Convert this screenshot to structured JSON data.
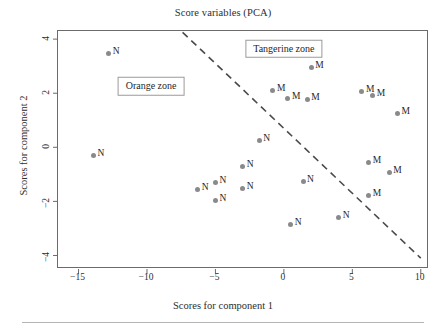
{
  "chart_data": {
    "type": "scatter",
    "title": "Score variables (PCA)",
    "xlabel": "Scores for component 1",
    "ylabel": "Scores for component 2",
    "xlim": [
      -16.5,
      10.6
    ],
    "ylim": [
      -4.5,
      4.3
    ],
    "xticks": [
      -15,
      -10,
      -5,
      0,
      5,
      10
    ],
    "yticks": [
      -4,
      -2,
      0,
      2,
      4
    ],
    "grid": false,
    "legend": "none",
    "marker_color": "#8a8a8a",
    "frame_color": "#6b6b6b",
    "series": [
      {
        "name": "N",
        "label": "N",
        "points": [
          {
            "x": -12.8,
            "y": 3.45,
            "label": "N"
          },
          {
            "x": -13.9,
            "y": -0.3,
            "label": "N"
          },
          {
            "x": -6.3,
            "y": -1.55,
            "label": "N"
          },
          {
            "x": -5.0,
            "y": -1.3,
            "label": "N"
          },
          {
            "x": -5.0,
            "y": -1.95,
            "label": "N"
          },
          {
            "x": -3.0,
            "y": -0.7,
            "label": "N"
          },
          {
            "x": -3.0,
            "y": -1.52,
            "label": "N"
          },
          {
            "x": -1.8,
            "y": 0.26,
            "label": "N"
          },
          {
            "x": 0.5,
            "y": -2.85,
            "label": "N"
          },
          {
            "x": 1.4,
            "y": -1.28,
            "label": "N"
          },
          {
            "x": 4.0,
            "y": -2.6,
            "label": "N"
          }
        ]
      },
      {
        "name": "M",
        "label": "M",
        "points": [
          {
            "x": -0.8,
            "y": 2.1,
            "label": "M"
          },
          {
            "x": 0.3,
            "y": 1.82,
            "label": "M"
          },
          {
            "x": 1.7,
            "y": 1.78,
            "label": "M"
          },
          {
            "x": 2.0,
            "y": 2.95,
            "label": "M"
          },
          {
            "x": 5.7,
            "y": 2.07,
            "label": "M"
          },
          {
            "x": 6.5,
            "y": 1.93,
            "label": "M"
          },
          {
            "x": 8.3,
            "y": 1.25,
            "label": "M"
          },
          {
            "x": 6.2,
            "y": -0.55,
            "label": "M"
          },
          {
            "x": 7.7,
            "y": -0.92,
            "label": "M"
          },
          {
            "x": 6.2,
            "y": -1.78,
            "label": "M"
          }
        ]
      }
    ],
    "divider_line": {
      "style": "dashed",
      "color": "#4a4a4a",
      "x_start": -7.4,
      "y_start": 4.25,
      "x_end": 10.0,
      "y_end": -4.1
    },
    "annotations": [
      {
        "name": "tangerine-zone",
        "text": "Tangerine zone",
        "x": 0.0,
        "y": 3.65
      },
      {
        "name": "orange-zone",
        "text": "Orange zone",
        "x": -9.7,
        "y": 2.25
      }
    ]
  }
}
